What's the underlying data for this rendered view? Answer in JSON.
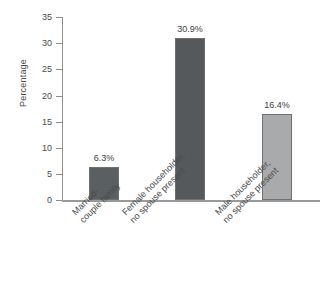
{
  "chart_data": {
    "type": "bar",
    "title": "",
    "subtitle": "",
    "xlabel": "",
    "ylabel": "Percentage",
    "ylim": [
      0,
      35
    ],
    "yticks": [
      0,
      5,
      10,
      15,
      20,
      25,
      30,
      35
    ],
    "ytick_labels": [
      "0",
      "5",
      "10",
      "15",
      "20",
      "25",
      "30",
      "35"
    ],
    "grid": false,
    "legend": null,
    "categories": [
      "Married-couple family",
      "Female householder, no spouse present",
      "Male householder, no spouse present"
    ],
    "category_lines": [
      [
        "Married-",
        "couple family"
      ],
      [
        "Female householder,",
        "no spouse present"
      ],
      [
        "Male householder,",
        "no spouse present"
      ]
    ],
    "values": [
      6.3,
      30.9,
      16.4
    ],
    "value_labels": [
      "6.3%",
      "30.9%",
      "16.4%"
    ],
    "bar_colors": [
      "#5a5f61",
      "#55595b",
      "#a9aaac"
    ],
    "bar_border_color": "#6e7173",
    "axis_color": "#8d8d8d",
    "baseline_color": "#9a9a9a",
    "text_color": "#4a4a4a",
    "background": "#ffffff"
  }
}
